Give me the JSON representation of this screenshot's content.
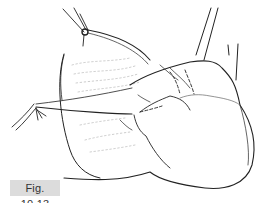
{
  "figure": {
    "label": "Fig. 10.13",
    "label_bg": "#dcdcdc"
  },
  "instruments": [
    {
      "name": "forceps-top-left"
    },
    {
      "name": "instrument-top-right"
    },
    {
      "name": "needle-holder-left"
    }
  ]
}
